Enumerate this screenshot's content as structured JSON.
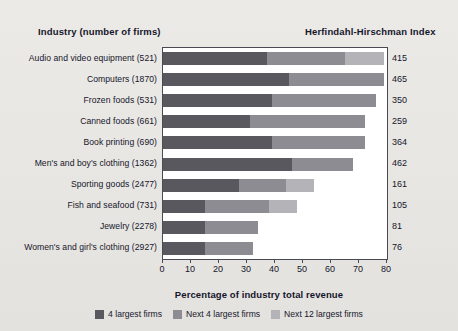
{
  "header": {
    "industry_title": "Industry (number of firms)",
    "hhi_title": "Herfindahl-Hirschman Index"
  },
  "axis": {
    "xlabel": "Percentage of industry total revenue",
    "ticks": [
      "0",
      "10",
      "20",
      "30",
      "40",
      "50",
      "60",
      "70",
      "80"
    ]
  },
  "legend": [
    {
      "label": "4 largest firms",
      "color": "#58585e"
    },
    {
      "label": "Next 4 largest firms",
      "color": "#8c8c92"
    },
    {
      "label": "Next 12 largest firms",
      "color": "#b4b4b8"
    }
  ],
  "chart_data": {
    "type": "bar",
    "orientation": "horizontal",
    "stacked": true,
    "title": "",
    "xlabel": "Percentage of industry total revenue",
    "ylabel": "Industry (number of firms)",
    "xlim": [
      0,
      80
    ],
    "grid": false,
    "legend_position": "bottom",
    "categories": [
      "Audio and video equipment  (521)",
      "Computers  (1870)",
      "Frozen foods  (531)",
      "Canned foods  (661)",
      "Book printing  (690)",
      "Men's and boy's clothing  (1362)",
      "Sporting goods  (2477)",
      "Fish and seafood  (731)",
      "Jewelry  (2278)",
      "Women's and girl's clothing  (2927)"
    ],
    "series": [
      {
        "name": "4 largest firms",
        "values": [
          37,
          45,
          39,
          31,
          39,
          46,
          27,
          15,
          15,
          15
        ]
      },
      {
        "name": "Next 4 largest firms",
        "values": [
          28,
          34,
          37,
          41,
          33,
          22,
          17,
          23,
          19,
          17
        ]
      },
      {
        "name": "Next 12 largest firms",
        "values": [
          14,
          0,
          0,
          0,
          0,
          0,
          10,
          10,
          0,
          0
        ]
      }
    ],
    "annotations": {
      "name": "Herfindahl-Hirschman Index",
      "values": [
        415,
        465,
        350,
        259,
        364,
        462,
        161,
        105,
        81,
        76
      ]
    }
  }
}
